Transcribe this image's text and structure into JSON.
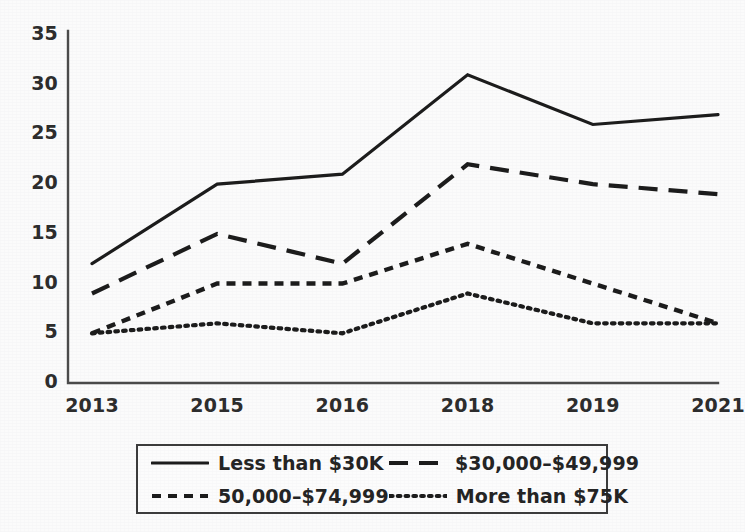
{
  "chart_data": {
    "type": "line",
    "title": "",
    "subtitle": "",
    "xlabel": "",
    "ylabel": "",
    "categories": [
      "2013",
      "2015",
      "2016",
      "2018",
      "2019",
      "2021"
    ],
    "yticks": [
      "0",
      "5",
      "10",
      "15",
      "20",
      "25",
      "30",
      "35"
    ],
    "ylim": [
      0,
      35
    ],
    "grid": false,
    "legend_position": "bottom",
    "series": [
      {
        "name": "Less than $30K",
        "style": "solid",
        "color": "#1b1b1b",
        "values": [
          12,
          20,
          21,
          31,
          26,
          27
        ]
      },
      {
        "name": "$30,000–$49,999",
        "style": "long-dash",
        "color": "#1b1b1b",
        "values": [
          9,
          15,
          12,
          22,
          20,
          19
        ]
      },
      {
        "name": "50,000–$74,999",
        "style": "short-dash",
        "color": "#1b1b1b",
        "values": [
          5,
          10,
          10,
          14,
          10,
          6
        ]
      },
      {
        "name": "More than $75K",
        "style": "dotted",
        "color": "#1b1b1b",
        "values": [
          5,
          6,
          5,
          9,
          6,
          6
        ]
      }
    ]
  },
  "axes": {
    "line_color": "#4a4a4a",
    "background": "#fbfbfb"
  },
  "legend": {
    "entries": [
      {
        "label": "Less than $30K",
        "style": "solid"
      },
      {
        "label": "$30,000–$49,999",
        "style": "long-dash"
      },
      {
        "label": "50,000–$74,999",
        "style": "short-dash"
      },
      {
        "label": "More than $75K",
        "style": "dotted"
      }
    ]
  }
}
